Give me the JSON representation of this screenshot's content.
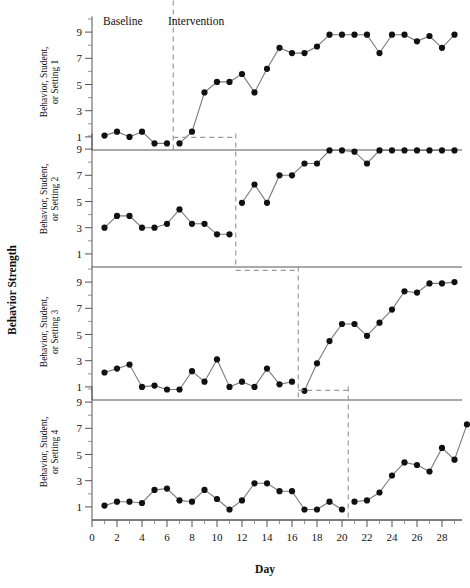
{
  "figure": {
    "ylabel_main": "Behavior Strength",
    "xlabel": "Day",
    "phase_labels": {
      "baseline": "Baseline",
      "intervention": "Intervention"
    },
    "x_ticks": [
      "0",
      "2",
      "4",
      "6",
      "8",
      "10",
      "12",
      "14",
      "16",
      "18",
      "20",
      "22",
      "24",
      "26",
      "28"
    ],
    "y_ticks": [
      "1",
      "3",
      "5",
      "7",
      "9"
    ],
    "panel_labels": [
      "Behavior, Student, or Setting 1",
      "Behavior, Student, or Setting 2",
      "Behavior, Student, or Setting 3",
      "Behavior, Student, or Setting 4"
    ],
    "colors": {
      "point": "#111111",
      "line": "#7a7a7a",
      "axis": "#555555",
      "phase_line": "#9a9a9a",
      "background": "#ffffff"
    }
  },
  "chart_data": {
    "type": "line",
    "title": "",
    "xlabel": "Day",
    "ylabel": "Behavior Strength",
    "xlim": [
      0,
      29
    ],
    "ylim": [
      0,
      10
    ],
    "grid": false,
    "legend": false,
    "x": [
      1,
      2,
      3,
      4,
      5,
      6,
      7,
      8,
      9,
      10,
      11,
      12,
      13,
      14,
      15,
      16,
      17,
      18,
      19,
      20,
      21,
      22,
      23,
      24,
      25,
      26,
      27,
      28,
      29
    ],
    "panels": [
      {
        "name": "Behavior, Student, or Setting 1",
        "phase_change_day": 6.5,
        "baseline_label": "Baseline",
        "intervention_label": "Intervention",
        "values": [
          1.1,
          1.4,
          1.0,
          1.4,
          0.5,
          0.5,
          0.5,
          1.4,
          4.4,
          5.2,
          5.2,
          5.8,
          4.4,
          6.2,
          7.8,
          7.4,
          7.4,
          7.9,
          8.8,
          8.8,
          8.8,
          8.8,
          7.4,
          8.8,
          8.8,
          8.3,
          8.7,
          7.8,
          8.8
        ]
      },
      {
        "name": "Behavior, Student, or Setting 2",
        "phase_change_day": 11.5,
        "values": [
          3.0,
          3.9,
          3.9,
          3.0,
          3.0,
          3.3,
          4.4,
          3.3,
          3.3,
          2.5,
          2.5,
          4.9,
          6.3,
          4.9,
          7.0,
          7.0,
          7.9,
          7.9,
          8.9,
          8.9,
          8.8,
          7.9,
          8.9,
          8.9,
          8.9,
          8.9,
          8.9,
          8.9,
          8.9
        ]
      },
      {
        "name": "Behavior, Student, or Setting 3",
        "phase_change_day": 16.5,
        "values": [
          2.1,
          2.4,
          2.7,
          1.0,
          1.1,
          0.8,
          0.8,
          2.2,
          1.4,
          3.1,
          1.0,
          1.4,
          1.0,
          2.4,
          1.2,
          1.4,
          0.7,
          2.8,
          4.5,
          5.8,
          5.8,
          4.9,
          5.9,
          6.9,
          8.3,
          8.2,
          8.9,
          8.9,
          9.0
        ]
      },
      {
        "name": "Behavior, Student, or Setting 4",
        "phase_change_day": 20.5,
        "values": [
          1.1,
          1.4,
          1.4,
          1.3,
          2.3,
          2.4,
          1.5,
          1.4,
          2.3,
          1.6,
          0.8,
          1.5,
          2.8,
          2.8,
          2.2,
          2.2,
          0.8,
          0.8,
          1.4,
          0.8,
          1.4,
          1.5,
          2.1,
          3.4,
          4.4,
          4.2,
          3.7,
          5.5,
          4.6,
          7.3
        ]
      }
    ]
  }
}
